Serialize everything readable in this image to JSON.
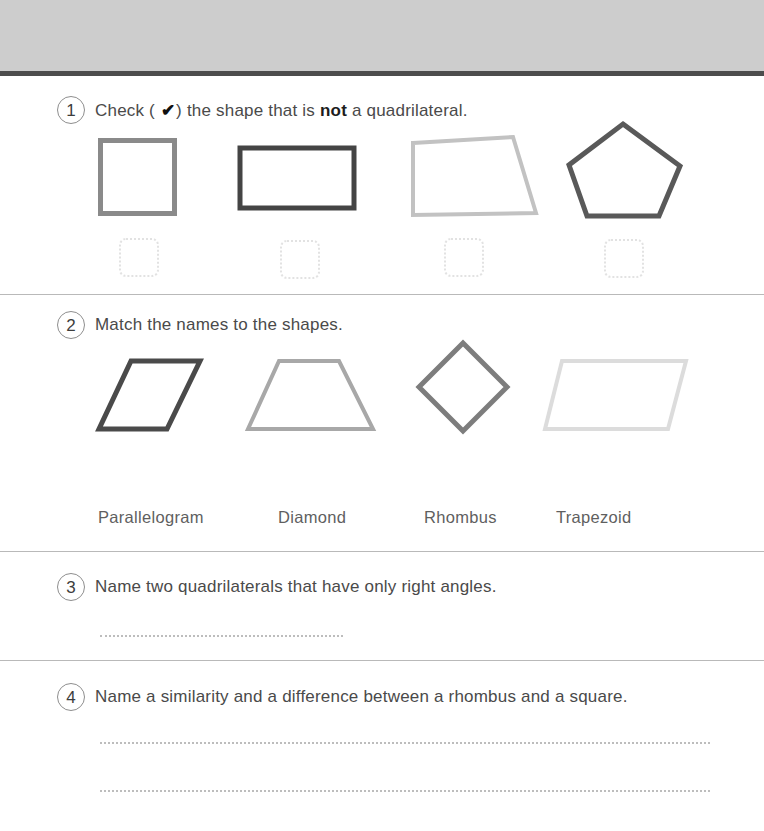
{
  "page": {
    "background": "#ffffff",
    "header_band_color": "#cdcdcd",
    "header_rule_color": "#4d4d4d",
    "divider_color": "#b9b9b9"
  },
  "questions": [
    {
      "number": "1",
      "prompt_before": "Check ( ",
      "tick_glyph": "✔",
      "prompt_middle": ") the shape that is ",
      "emphasis": "not",
      "prompt_after": " a quadrilateral."
    },
    {
      "number": "2",
      "prompt": "Match the names to the shapes."
    },
    {
      "number": "3",
      "prompt": "Name two quadrilaterals that have only right angles."
    },
    {
      "number": "4",
      "prompt": "Name a similarity and a difference between a rhombus and a square."
    }
  ],
  "q1_shapes": [
    {
      "name": "square",
      "stroke": "#8a8a8a"
    },
    {
      "name": "rectangle",
      "stroke": "#444444"
    },
    {
      "name": "trapezoid",
      "stroke": "#c2c2c2"
    },
    {
      "name": "pentagon",
      "stroke": "#595959"
    }
  ],
  "q1_checkboxes": [
    {
      "name": "checkbox-square",
      "checked": ""
    },
    {
      "name": "checkbox-rectangle",
      "checked": ""
    },
    {
      "name": "checkbox-trapezoid",
      "checked": ""
    },
    {
      "name": "checkbox-pentagon",
      "checked": ""
    }
  ],
  "q2_shapes": [
    {
      "name": "parallelogram",
      "stroke": "#4a4a4a"
    },
    {
      "name": "trapezoid",
      "stroke": "#a8a8a8"
    },
    {
      "name": "diamond",
      "stroke": "#7d7d7d"
    },
    {
      "name": "parallelogram-light",
      "stroke": "#dcdcdc"
    }
  ],
  "q2_names": [
    {
      "label": "Parallelogram"
    },
    {
      "label": "Diamond"
    },
    {
      "label": "Rhombus"
    },
    {
      "label": "Trapezoid"
    }
  ],
  "answer_lines": [
    {
      "owner": "question-3",
      "length": "short"
    },
    {
      "owner": "question-4",
      "length": "long"
    },
    {
      "owner": "question-4",
      "length": "long"
    }
  ]
}
